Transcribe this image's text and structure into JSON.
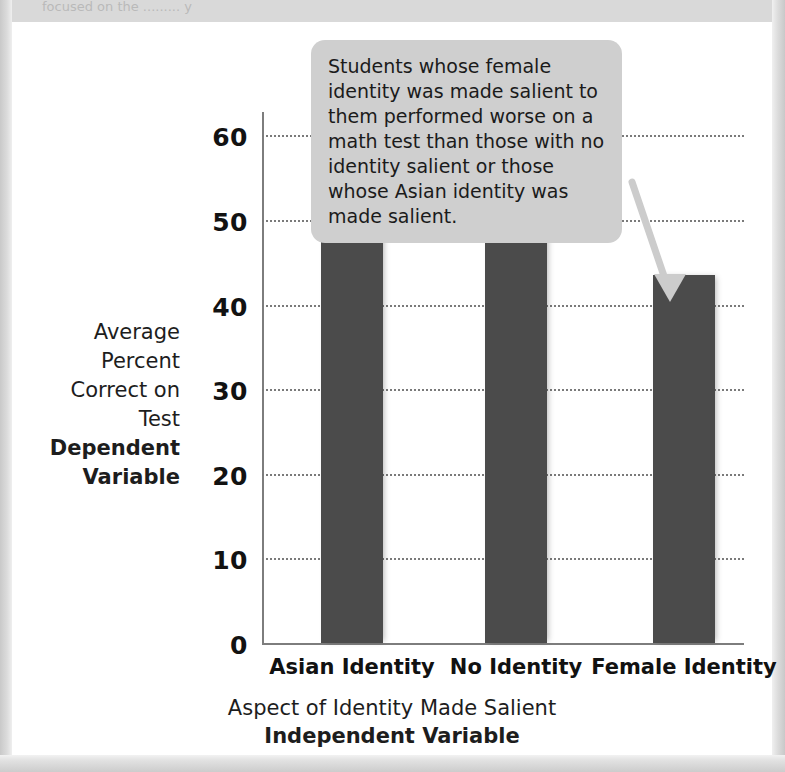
{
  "page": {
    "top_cut_text": "focused on the ......... y",
    "background_color": "#d9d9d9",
    "paper_color": "#ffffff"
  },
  "callout": {
    "text": "Students whose female identity was made salient to them performed worse on a math test than those with no identity salient or those whose Asian identity was made salient.",
    "background_color": "#cfcfcf",
    "arrow_color": "#cccccc"
  },
  "chart_data": {
    "type": "bar",
    "title": "",
    "categories": [
      "Asian Identity",
      "No Identity",
      "Female Identity"
    ],
    "values": [
      54,
      49,
      43.5
    ],
    "series": [
      {
        "name": "Average Percent Correct on Test",
        "values": [
          54,
          49,
          43.5
        ]
      }
    ],
    "xlabel": "Aspect of Identity Made Salient",
    "xlabel_bold": "Independent Variable",
    "ylabel_lines": [
      "Average",
      "Percent",
      "Correct on",
      "Test"
    ],
    "ylabel_bold": "Dependent Variable",
    "ylim": [
      0,
      63
    ],
    "yticks": [
      0,
      10,
      20,
      30,
      40,
      50,
      60
    ],
    "ytick_labels": [
      "0",
      "10",
      "20",
      "30",
      "40",
      "50",
      "60"
    ],
    "grid": "horizontal-dotted",
    "legend": "none",
    "bar_color": "#4b4b4b",
    "axis_color": "#7d7d7d",
    "annotation": "Students whose female identity was made salient to them performed worse on a math test than those with no identity salient or those whose Asian identity was made salient."
  }
}
